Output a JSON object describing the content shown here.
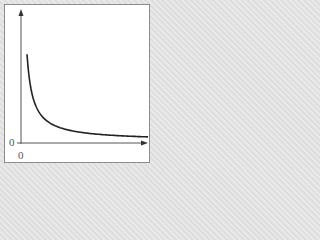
{
  "chart_data": {
    "type": "line",
    "title": "",
    "xlabel": "",
    "ylabel": "",
    "function": "y = k / x (inverse proportion, x > 0)",
    "x_origin_label": "0",
    "y_origin_label": "0",
    "x": [
      0.15,
      0.25,
      0.5,
      1,
      2,
      3,
      4,
      5
    ],
    "values": [
      6.67,
      4,
      2,
      1,
      0.5,
      0.33,
      0.25,
      0.2
    ],
    "grid": false,
    "legend": "none",
    "axes_arrows": true
  },
  "colors": {
    "curve": "#222222",
    "axes": "#555555",
    "border": "#8c8c8c"
  }
}
